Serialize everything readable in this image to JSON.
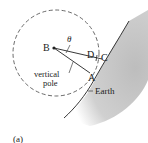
{
  "figure": {
    "caption": "(a)",
    "labels": {
      "B": "B",
      "theta": "θ",
      "D": "D",
      "C": "C",
      "A": "A",
      "vertical_line1": "vertical",
      "vertical_line2": "pole",
      "earth": "Earth"
    },
    "colors": {
      "line": "#222222",
      "earth_fill": "#c8c8c8",
      "circle_dash": "#444444"
    }
  }
}
